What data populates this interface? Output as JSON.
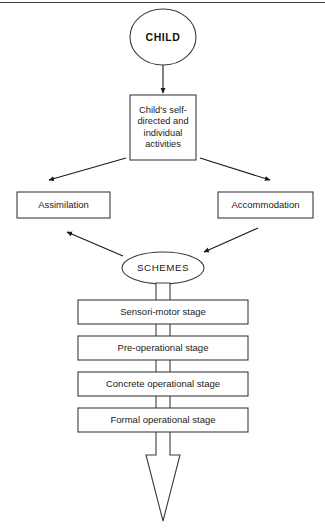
{
  "diagram": {
    "title_node": {
      "label": "CHILD",
      "shape": "ellipse"
    },
    "activities_node": {
      "label": "Child's self-directed and individual activities",
      "shape": "rect"
    },
    "assimilation_node": {
      "label": "Assimilation",
      "shape": "rect"
    },
    "accommodation_node": {
      "label": "Accommodation",
      "shape": "rect"
    },
    "schemes_node": {
      "label": "SCHEMES",
      "shape": "ellipse"
    },
    "stages": [
      {
        "label": "Sensori-motor stage"
      },
      {
        "label": "Pre-operational stage"
      },
      {
        "label": "Concrete operational stage"
      },
      {
        "label": "Formal operational stage"
      }
    ],
    "colors": {
      "stroke": "#3c3c41",
      "text": "#1a1a1a",
      "fill": "#ffffff",
      "rule": "#3c3c41"
    }
  }
}
